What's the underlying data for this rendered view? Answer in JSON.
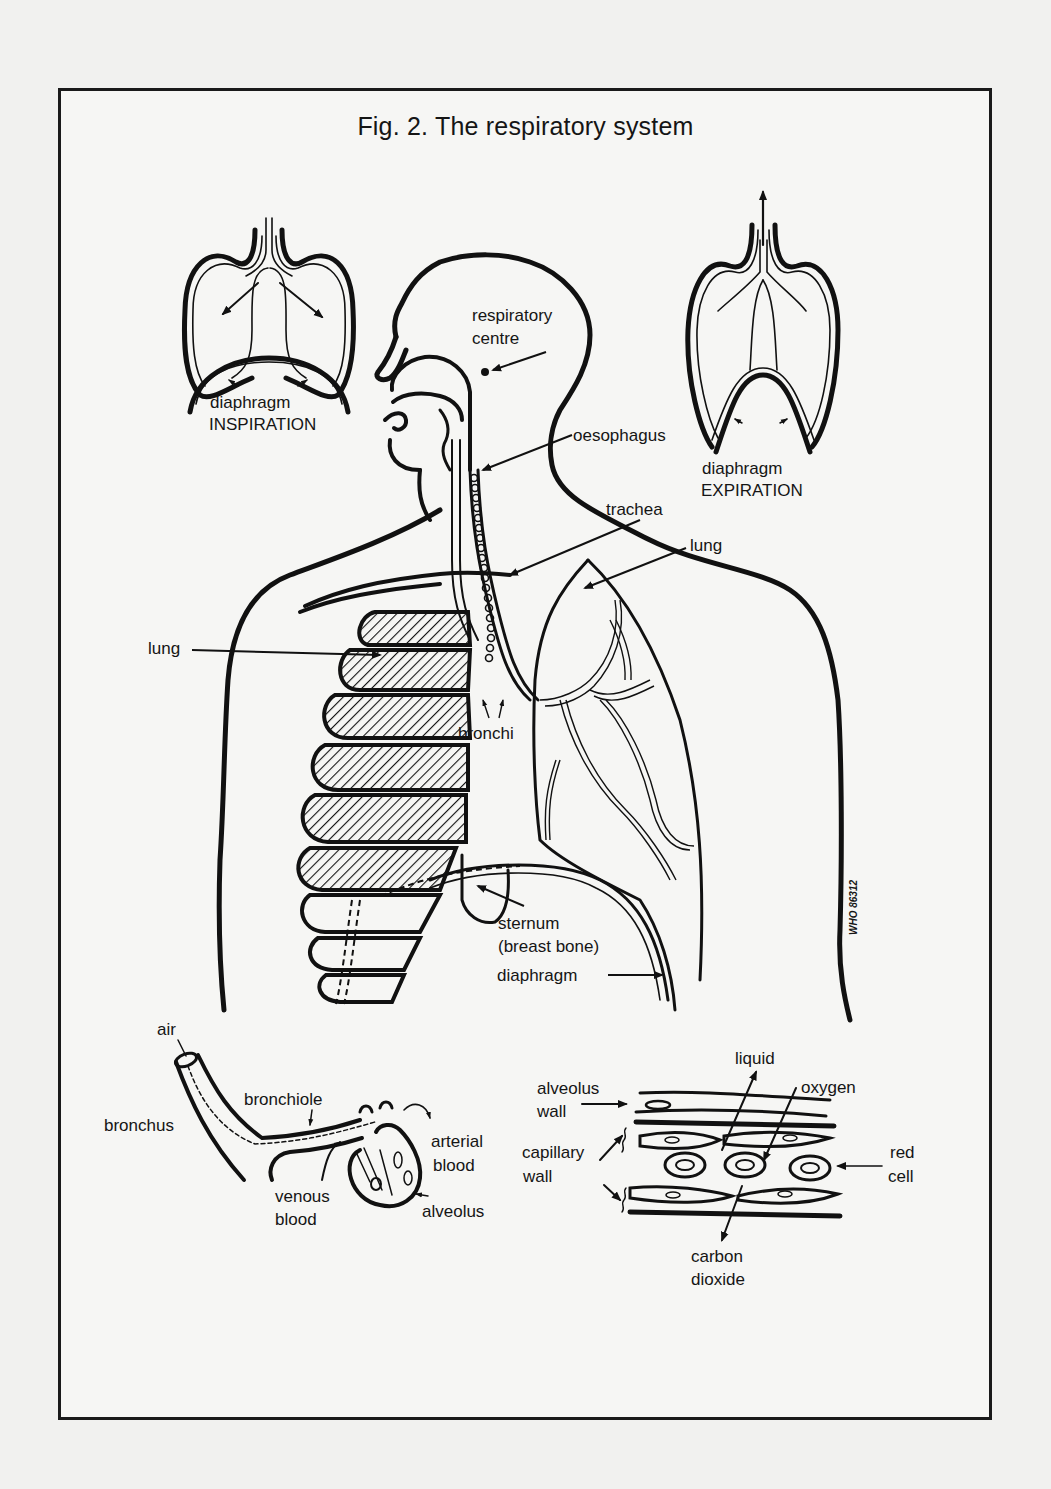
{
  "figure": {
    "title": "Fig. 2. The respiratory system",
    "credit": "WHO 86312"
  },
  "insets": {
    "inspiration": {
      "label1": "diaphragm",
      "label2": "INSPIRATION"
    },
    "expiration": {
      "label1": "diaphragm",
      "label2": "EXPIRATION"
    }
  },
  "body_labels": {
    "respiratory_centre_1": "respiratory",
    "respiratory_centre_2": "centre",
    "oesophagus": "oesophagus",
    "trachea": "trachea",
    "lung_right": "lung",
    "lung_left": "lung",
    "bronchi": "bronchi",
    "sternum_1": "sternum",
    "sternum_2": "(breast bone)",
    "diaphragm": "diaphragm"
  },
  "airway_detail": {
    "air": "air",
    "bronchus": "bronchus",
    "bronchiole": "bronchiole",
    "arterial_1": "arterial",
    "arterial_2": "blood",
    "venous_1": "venous",
    "venous_2": "blood",
    "alveolus": "alveolus"
  },
  "exchange_detail": {
    "liquid": "liquid",
    "oxygen": "oxygen",
    "alveolus_wall_1": "alveolus",
    "alveolus_wall_2": "wall",
    "capillary_wall_1": "capillary",
    "capillary_wall_2": "wall",
    "red_cell_1": "red",
    "red_cell_2": "cell",
    "co2_1": "carbon",
    "co2_2": "dioxide"
  }
}
